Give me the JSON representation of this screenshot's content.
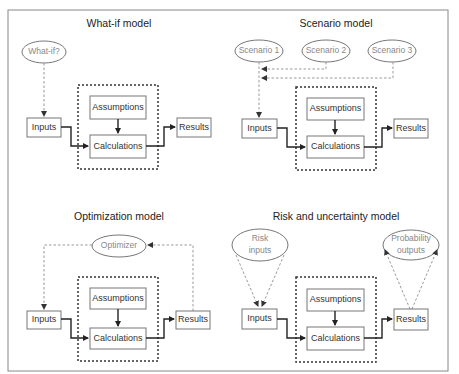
{
  "header": {
    "cutoff_text": "Types of modeling"
  },
  "colors": {
    "frame": "#888888",
    "flow": "#222222",
    "dashed": "#999999",
    "ellipse_text": "#888888"
  },
  "panels": {
    "whatif": {
      "title": "What-if model",
      "ellipse": "What-if?",
      "inputs": "Inputs",
      "assumptions": "Assumptions",
      "calculations": "Calculations",
      "results": "Results"
    },
    "scenario": {
      "title": "Scenario model",
      "ellipses": [
        "Scenario 1",
        "Scenario 2",
        "Scenario 3"
      ],
      "inputs": "Inputs",
      "assumptions": "Assumptions",
      "calculations": "Calculations",
      "results": "Results"
    },
    "optimization": {
      "title": "Optimization model",
      "ellipse": "Optimizer",
      "inputs": "Inputs",
      "assumptions": "Assumptions",
      "calculations": "Calculations",
      "results": "Results"
    },
    "risk": {
      "title": "Risk and uncertainty model",
      "ellipse_left_line1": "Risk",
      "ellipse_left_line2": "inputs",
      "ellipse_right_line1": "Probability",
      "ellipse_right_line2": "outputs",
      "inputs": "Inputs",
      "assumptions": "Assumptions",
      "calculations": "Calculations",
      "results": "Results"
    }
  }
}
